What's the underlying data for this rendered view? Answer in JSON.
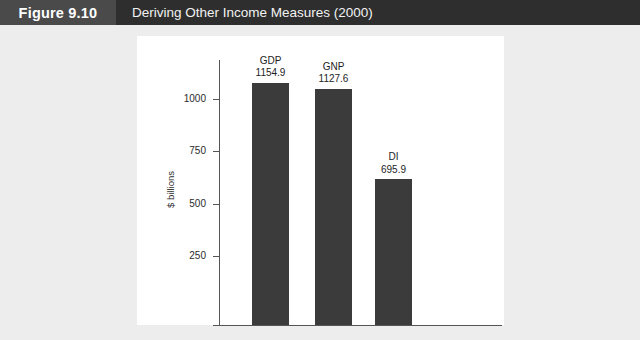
{
  "figure": {
    "number_label": "Figure 9.10",
    "title": "Deriving Other Income Measures (2000)"
  },
  "colors": {
    "title_bar": "#2e2e2e",
    "number_block": "#4a4a4a",
    "page_background": "#ededed",
    "panel_background": "#ffffff",
    "bar": "#3b3b3b",
    "axis": "#555555"
  },
  "chart_data": {
    "type": "bar",
    "title": "Deriving Other Income Measures (2000)",
    "categories": [
      "GDP",
      "GNP",
      "DI"
    ],
    "values": [
      1154.9,
      1127.6,
      695.9
    ],
    "value_labels": [
      "1154.9",
      "1127.6",
      "695.9"
    ],
    "xlabel": "",
    "ylabel": "$ billions",
    "ylim": [
      0,
      1250
    ],
    "yticks": [
      250,
      500,
      750,
      1000
    ],
    "ytick_labels": [
      "250",
      "500",
      "750",
      "1000"
    ],
    "grid": false,
    "legend": false,
    "labels_above_bars": true
  }
}
